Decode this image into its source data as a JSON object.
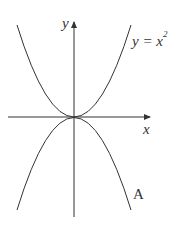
{
  "diagram": {
    "axes": {
      "x_label": "x",
      "y_label": "y"
    },
    "curves": [
      {
        "name": "parabola-up",
        "equation_lhs": "y = x",
        "equation_exp": "2",
        "shape": "opens upward, vertex at origin"
      },
      {
        "name": "curve-A",
        "label": "A",
        "shape": "opens downward, vertex at origin"
      }
    ],
    "colors": {
      "line": "#333333",
      "background": "#ffffff"
    }
  }
}
